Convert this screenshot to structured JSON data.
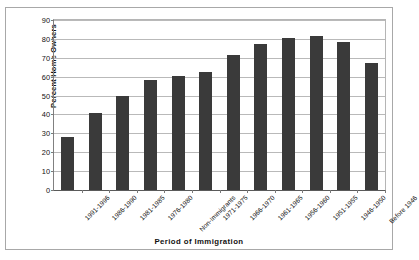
{
  "figure": {
    "cropped_top_text": "........ ............ ..... .... ..... ...... ......., .... ... ..... .... ........ . .....",
    "x_axis_title": "Period of Immigration",
    "y_axis_title": "Percent Home Owners",
    "bar_color": "#3a3a3a",
    "grid_color": "#b9b9b9",
    "axis_color": "#5a5a5a",
    "frame_color": "#a8a8a8",
    "background": "#ffffff"
  },
  "chart_data": {
    "type": "bar",
    "title": "",
    "xlabel": "Period of Immigration",
    "ylabel": "Percent Home Owners",
    "ylim": [
      0,
      90
    ],
    "yticks": [
      0,
      10,
      20,
      30,
      40,
      50,
      60,
      70,
      80,
      90
    ],
    "grid": true,
    "legend": false,
    "categories": [
      "1991-1996",
      "1986-1990",
      "1981-1985",
      "1976-1980",
      "Non-Immigrants",
      "1971-1975",
      "1966-1970",
      "1961-1965",
      "1956-1960",
      "1951-1955",
      "1946-1950",
      "Before 1946"
    ],
    "values": [
      28,
      41,
      50,
      58.5,
      60.5,
      62.5,
      71.5,
      77.5,
      80.5,
      81.5,
      78.5,
      67
    ]
  }
}
